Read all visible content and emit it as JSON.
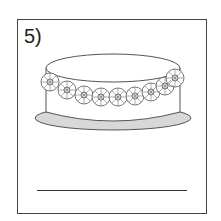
{
  "worksheet": {
    "item_number": "5)",
    "illustration": "cake-with-flower-garland",
    "flower_count": 9,
    "answer_line": ""
  },
  "colors": {
    "outline": "#444444",
    "plate": "#d8d8d8",
    "background": "#ffffff"
  }
}
